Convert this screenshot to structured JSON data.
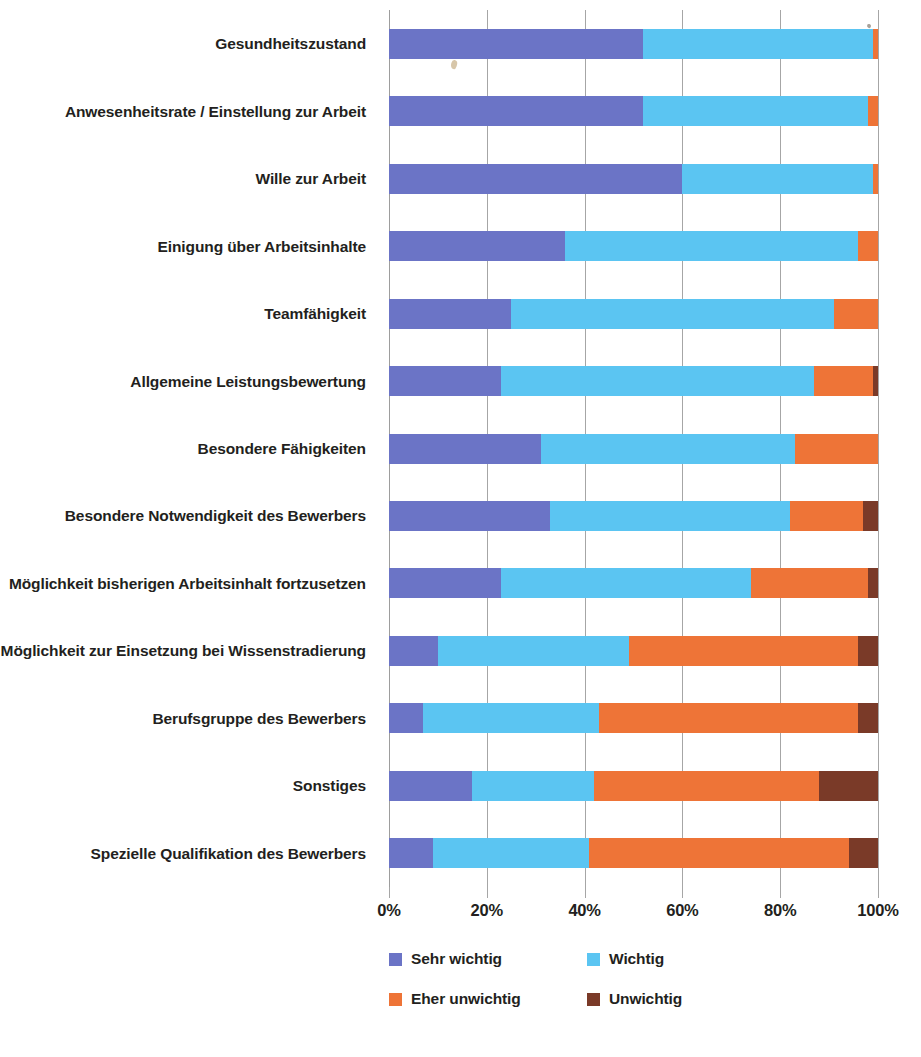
{
  "chart_data": {
    "type": "bar",
    "subtype": "stacked-horizontal-100-percent",
    "title": "",
    "xlabel": "",
    "ylabel": "",
    "xlim": [
      0,
      100
    ],
    "xticks": [
      "0%",
      "20%",
      "40%",
      "60%",
      "80%",
      "100%"
    ],
    "xtick_values": [
      0,
      20,
      40,
      60,
      80,
      100
    ],
    "grid": true,
    "legend_position": "bottom",
    "categories": [
      "Gesundheitszustand",
      "Anwesenheitsrate / Einstellung zur Arbeit",
      "Wille zur Arbeit",
      "Einigung über Arbeitsinhalte",
      "Teamfähigkeit",
      "Allgemeine Leistungsbewertung",
      "Besondere Fähigkeiten",
      "Besondere Notwendigkeit des Bewerbers",
      "Möglichkeit bisherigen Arbeitsinhalt fortzusetzen",
      "Möglichkeit zur Einsetzung bei Wissenstradierung",
      "Berufsgruppe des Bewerbers",
      "Sonstiges",
      "Spezielle Qualifikation des Bewerbers"
    ],
    "series": [
      {
        "name": "Sehr wichtig",
        "color": "#6b74c6",
        "values": [
          52,
          52,
          60,
          36,
          25,
          23,
          31,
          33,
          23,
          10,
          7,
          17,
          9
        ]
      },
      {
        "name": "Wichtig",
        "color": "#5bc5f2",
        "values": [
          47,
          46,
          39,
          60,
          66,
          64,
          52,
          49,
          51,
          39,
          36,
          25,
          32
        ]
      },
      {
        "name": "Eher unwichtig",
        "color": "#ee7437",
        "values": [
          1,
          2,
          1,
          4,
          9,
          12,
          17,
          15,
          24,
          47,
          53,
          46,
          53
        ]
      },
      {
        "name": "Unwichtig",
        "color": "#7a3a28",
        "values": [
          0,
          0,
          0,
          0,
          0,
          1,
          0,
          3,
          2,
          4,
          4,
          12,
          6
        ]
      }
    ]
  },
  "axis": {
    "tick_labels": [
      "0%",
      "20%",
      "40%",
      "60%",
      "80%",
      "100%"
    ]
  },
  "legend": {
    "items": [
      {
        "label": "Sehr wichtig",
        "color": "#6b74c6"
      },
      {
        "label": "Wichtig",
        "color": "#5bc5f2"
      },
      {
        "label": "Eher unwichtig",
        "color": "#ee7437"
      },
      {
        "label": "Unwichtig",
        "color": "#7a3a28"
      }
    ]
  }
}
